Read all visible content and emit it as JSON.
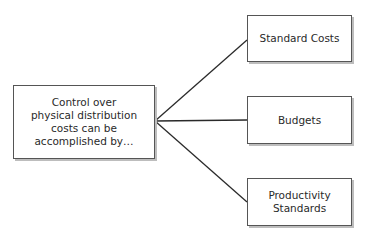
{
  "diagram": {
    "source": {
      "label": "Control over\nphysical distribution\ncosts can be\naccomplished by…"
    },
    "targets": [
      {
        "label": "Standard Costs"
      },
      {
        "label": "Budgets"
      },
      {
        "label": "Productivity\nStandards"
      }
    ],
    "colors": {
      "line": "#2a2a2a",
      "border": "#555555",
      "shadow": "#bdbdbd"
    }
  }
}
